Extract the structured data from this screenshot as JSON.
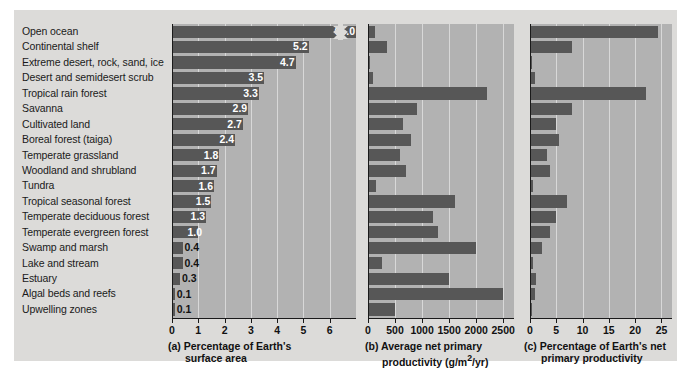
{
  "chart_data": {
    "type": "bar",
    "title": "",
    "orientation": "horizontal",
    "categories": [
      "Open ocean",
      "Continental shelf",
      "Extreme desert, rock, sand, ice",
      "Desert and semidesert scrub",
      "Tropical rain forest",
      "Savanna",
      "Cultivated land",
      "Boreal forest (taiga)",
      "Temperate grassland",
      "Woodland and shrubland",
      "Tundra",
      "Tropical seasonal forest",
      "Temperate deciduous forest",
      "Temperate evergreen forest",
      "Swamp and marsh",
      "Lake and stream",
      "Estuary",
      "Algal beds and reefs",
      "Upwelling zones"
    ],
    "panels": [
      {
        "key": "a",
        "tag": "(a)",
        "title_line1": "Percentage of Earth's",
        "title_line2": "surface area",
        "xlabel": "Percentage of Earth's surface area",
        "ylabel": "",
        "values": [
          65.0,
          5.2,
          4.7,
          3.5,
          3.3,
          2.9,
          2.7,
          2.4,
          1.8,
          1.7,
          1.6,
          1.5,
          1.3,
          1.0,
          0.4,
          0.4,
          0.3,
          0.1,
          0.1
        ],
        "value_labels": [
          "65.0",
          "5.2",
          "4.7",
          "3.5",
          "3.3",
          "2.9",
          "2.7",
          "2.4",
          "1.8",
          "1.7",
          "1.6",
          "1.5",
          "1.3",
          "1.0",
          "0.4",
          "0.4",
          "0.3",
          "0.1",
          "0.1"
        ],
        "ticks": [
          0,
          1,
          2,
          3,
          4,
          5,
          6
        ],
        "tick_labels": [
          "0",
          "1",
          "2",
          "3",
          "4",
          "5",
          "6"
        ],
        "xlim": [
          0,
          7
        ],
        "axis_break": true,
        "axis_break_note": "Open ocean bar (65.0) is truncated by an axis break",
        "grid": true
      },
      {
        "key": "b",
        "tag": "(b)",
        "title_line1": "Average net primary",
        "title_line2": "productivity (g/m2/yr)",
        "title_line2_html": "productivity (g/m<sup>2</sup>/yr)",
        "xlabel": "Average net primary productivity (g/m2/yr)",
        "units": "g/m2/yr",
        "values": [
          125,
          360,
          3,
          90,
          2200,
          900,
          650,
          800,
          600,
          700,
          140,
          1600,
          1200,
          1300,
          2000,
          250,
          1500,
          2500,
          500
        ],
        "ticks": [
          0,
          500,
          1000,
          1500,
          2000,
          2500
        ],
        "tick_labels": [
          "0",
          "500",
          "1000",
          "1500",
          "2000",
          "2500"
        ],
        "xlim": [
          0,
          2700
        ],
        "grid": true
      },
      {
        "key": "c",
        "tag": "(c)",
        "title_line1": "Percentage of Earth's net",
        "title_line2": "primary productivity",
        "xlabel": "Percentage of Earth's net primary productivity",
        "values": [
          24.4,
          7.9,
          0.1,
          0.9,
          22.0,
          7.9,
          4.9,
          5.6,
          3.2,
          3.8,
          0.6,
          7.1,
          4.9,
          3.8,
          2.3,
          0.5,
          1.1,
          0.9,
          0.1
        ],
        "ticks": [
          0,
          5,
          10,
          15,
          20,
          25
        ],
        "tick_labels": [
          "0",
          "5",
          "10",
          "15",
          "20",
          "25"
        ],
        "xlim": [
          0,
          27
        ],
        "grid": true
      }
    ],
    "colors": {
      "bar": "#575757",
      "plot_background": "#b2b2b2",
      "card_background": "#dcdbd9",
      "page_background": "#ffffff",
      "gridline": "#d8d8d8",
      "axis": "#1a1a1a",
      "value_text": "#ffffff",
      "label_text": "#1a1a1a"
    }
  }
}
